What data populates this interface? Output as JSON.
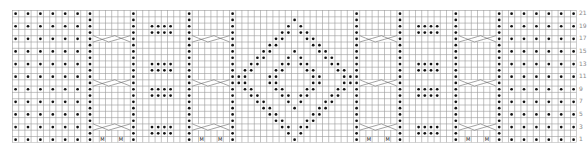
{
  "chart": {
    "type": "knitting-chart",
    "columns": 91,
    "rows": 21,
    "cell_width": 6.2,
    "cell_height": 6.3,
    "colors": {
      "grid": "#9a9a9a",
      "grid_bg": "#ffffff",
      "symbol": "#111111",
      "cable": "#666666",
      "label": "#888888"
    },
    "row_labels": [
      "21",
      "19",
      "17",
      "15",
      "13",
      "11",
      "9",
      "7",
      "5",
      "3",
      "1"
    ],
    "legend_symbols": {
      "purl": "dot",
      "make_one": "M",
      "cable": "6-stitch cross"
    },
    "purl_columns": [
      12,
      19,
      28,
      35,
      55,
      62,
      71,
      78
    ],
    "seed_blocks": [
      {
        "name": "left-edge-block",
        "cols": [
          0,
          2,
          4,
          6,
          8,
          10
        ]
      },
      {
        "name": "right-edge-block",
        "cols": [
          80,
          82,
          84,
          86,
          88,
          90
        ]
      }
    ],
    "cable_blocks": [
      {
        "name": "cable-1",
        "start": 13,
        "width": 6
      },
      {
        "name": "cable-2",
        "start": 29,
        "width": 6
      },
      {
        "name": "cable-3",
        "start": 56,
        "width": 6
      },
      {
        "name": "cable-4",
        "start": 72,
        "width": 6
      }
    ],
    "cable_cross_rows": [
      4,
      11,
      18
    ],
    "make_one_row": 20,
    "make_one_offsets": [
      1,
      4
    ],
    "dot_blocks": [
      {
        "name": "dot-block-left",
        "start": 22,
        "width": 4,
        "row_pairs": [
          [
            2,
            3
          ],
          [
            8,
            9
          ],
          [
            12,
            13
          ],
          [
            18,
            19
          ]
        ]
      },
      {
        "name": "dot-block-right",
        "start": 65,
        "width": 4,
        "row_pairs": [
          [
            2,
            3
          ],
          [
            8,
            9
          ],
          [
            12,
            13
          ],
          [
            18,
            19
          ]
        ]
      }
    ],
    "diamond": {
      "center_col": 45,
      "outer": [
        [
          1,
          [
            45
          ]
        ],
        [
          2,
          [
            44,
            46
          ]
        ],
        [
          3,
          [
            43,
            44,
            46,
            47
          ]
        ],
        [
          4,
          [
            42,
            43,
            47,
            48
          ]
        ],
        [
          5,
          [
            41,
            42,
            48,
            49
          ]
        ],
        [
          6,
          [
            40,
            41,
            45,
            49,
            50
          ]
        ],
        [
          7,
          [
            39,
            40,
            44,
            46,
            50,
            51
          ]
        ],
        [
          8,
          [
            38,
            39,
            43,
            44,
            46,
            47,
            51,
            52
          ]
        ],
        [
          9,
          [
            37,
            38,
            42,
            43,
            47,
            48,
            52,
            53
          ]
        ],
        [
          10,
          [
            36,
            37,
            41,
            42,
            48,
            49,
            53,
            54
          ]
        ],
        [
          11,
          [
            36,
            37,
            41,
            42,
            48,
            49,
            53,
            54
          ]
        ],
        [
          12,
          [
            37,
            38,
            42,
            43,
            47,
            48,
            52,
            53
          ]
        ],
        [
          13,
          [
            38,
            39,
            43,
            44,
            46,
            47,
            51,
            52
          ]
        ],
        [
          14,
          [
            39,
            40,
            44,
            46,
            50,
            51
          ]
        ],
        [
          15,
          [
            40,
            41,
            45,
            49,
            50
          ]
        ],
        [
          16,
          [
            41,
            42,
            48,
            49
          ]
        ],
        [
          17,
          [
            42,
            43,
            47,
            48
          ]
        ],
        [
          18,
          [
            43,
            44,
            46,
            47
          ]
        ],
        [
          19,
          [
            44,
            46
          ]
        ],
        [
          20,
          [
            45
          ]
        ]
      ]
    }
  }
}
